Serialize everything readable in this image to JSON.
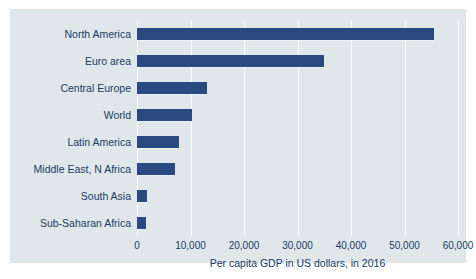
{
  "chart_data": {
    "type": "bar",
    "orientation": "horizontal",
    "title": "",
    "xlabel": "Per capita GDP in US dollars, in 2016",
    "ylabel": "",
    "categories": [
      "North America",
      "Euro area",
      "Central Europe",
      "World",
      "Latin America",
      "Middle East, N Africa",
      "South Asia",
      "Sub-Saharan Africa"
    ],
    "values": [
      55500,
      35000,
      13000,
      10200,
      7900,
      7100,
      1800,
      1600
    ],
    "xlim": [
      0,
      60000
    ],
    "xticks": [
      0,
      10000,
      20000,
      30000,
      40000,
      50000,
      60000
    ],
    "xtick_labels": [
      "0",
      "10,000",
      "20,000",
      "30,000",
      "40,000",
      "50,000",
      "60,000"
    ],
    "grid": "vertical",
    "legend": "none",
    "bar_color": "#2b4a82",
    "panel_color": "#dfe7ea",
    "gridline_color": "#fbfdfd",
    "text_color": "#1b3a63"
  }
}
